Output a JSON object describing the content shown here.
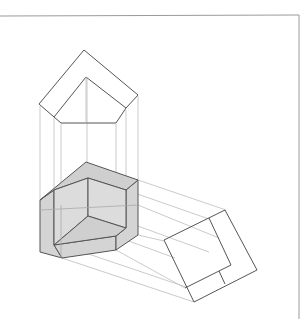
{
  "figure": {
    "colors": {
      "edge": "#555555",
      "projection_line": "#bdbdbd",
      "solid_fill": "#d4d4d4",
      "frame": "#9a9a9a"
    },
    "views": [
      {
        "name": "top-view",
        "label": ""
      },
      {
        "name": "isometric-solid",
        "label": ""
      },
      {
        "name": "side-view",
        "label": ""
      }
    ]
  }
}
